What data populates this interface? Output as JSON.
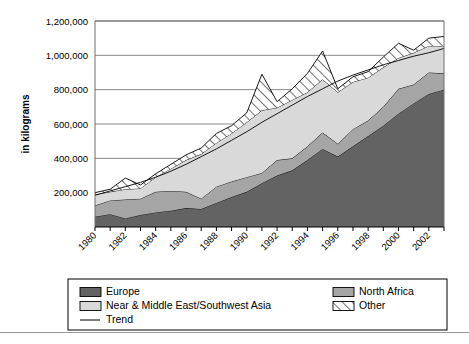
{
  "chart_data": {
    "type": "area",
    "title": "",
    "subtitle": "",
    "xlabel": "",
    "ylabel": "in kilograms",
    "ylim": [
      0,
      1200000
    ],
    "ytick_values": [
      0,
      200000,
      400000,
      600000,
      800000,
      1000000,
      1200000
    ],
    "ytick_labels": [
      "0",
      "200,000",
      "400,000",
      "600,000",
      "800,000",
      "1,000,000",
      "1,200,000"
    ],
    "ytick_label_visible": [
      "",
      "200,000",
      "400,000",
      "600,000",
      "800,000",
      "1,000,000",
      "1,200,000"
    ],
    "grid": true,
    "grid_axis": "y",
    "stacked": true,
    "legend_position": "bottom",
    "x": [
      1980,
      1981,
      1982,
      1983,
      1984,
      1985,
      1986,
      1987,
      1988,
      1989,
      1990,
      1991,
      1992,
      1993,
      1994,
      1995,
      1996,
      1997,
      1998,
      1999,
      2000,
      2001,
      2002,
      2003
    ],
    "xtick_labels": [
      "1980",
      "",
      "1982",
      "",
      "1984",
      "",
      "1986",
      "",
      "1988",
      "",
      "1990",
      "",
      "1992",
      "",
      "1994",
      "",
      "1996",
      "",
      "1998",
      "",
      "2000",
      "",
      "2002",
      ""
    ],
    "xtick_labels_all": [
      "1980",
      "1981",
      "1982",
      "1983",
      "1984",
      "1985",
      "1986",
      "1987",
      "1988",
      "1989",
      "1990",
      "1991",
      "1992",
      "1993",
      "1994",
      "1995",
      "1996",
      "1997",
      "1998",
      "1999",
      "2000",
      "2001",
      "2002",
      "2003"
    ],
    "xtick_rotation": -45,
    "series": [
      {
        "name": "Europe",
        "color": "#636363",
        "pattern": "solid",
        "values": [
          60000,
          75000,
          50000,
          70000,
          85000,
          95000,
          110000,
          105000,
          140000,
          175000,
          205000,
          255000,
          300000,
          330000,
          390000,
          455000,
          410000,
          470000,
          530000,
          590000,
          660000,
          720000,
          775000,
          800000
        ]
      },
      {
        "name": "North Africa",
        "color": "#a5a5a5",
        "pattern": "solid",
        "values": [
          65000,
          80000,
          110000,
          95000,
          120000,
          115000,
          95000,
          60000,
          95000,
          90000,
          85000,
          60000,
          90000,
          70000,
          80000,
          95000,
          75000,
          100000,
          90000,
          110000,
          145000,
          110000,
          125000,
          95000
        ]
      },
      {
        "name": "Near & Middle East/Southwest Asia",
        "color": "#d9d9d9",
        "pattern": "solid",
        "values": [
          65000,
          50000,
          60000,
          60000,
          85000,
          130000,
          185000,
          260000,
          255000,
          280000,
          320000,
          365000,
          305000,
          340000,
          315000,
          310000,
          300000,
          275000,
          250000,
          230000,
          180000,
          185000,
          155000,
          160000
        ]
      },
      {
        "name": "Other",
        "color": "#ffffff",
        "pattern": "hatch",
        "values": [
          10000,
          15000,
          65000,
          20000,
          20000,
          25000,
          30000,
          35000,
          55000,
          45000,
          55000,
          210000,
          35000,
          65000,
          110000,
          165000,
          20000,
          30000,
          35000,
          60000,
          85000,
          15000,
          45000,
          55000
        ]
      }
    ],
    "trend": {
      "name": "Trend",
      "color": "#000000",
      "values": [
        185000,
        210000,
        235000,
        260000,
        290000,
        325000,
        365000,
        410000,
        455000,
        505000,
        555000,
        610000,
        660000,
        710000,
        760000,
        805000,
        850000,
        885000,
        915000,
        945000,
        970000,
        995000,
        1015000,
        1040000
      ]
    },
    "totals": [
      200000,
      220000,
      285000,
      245000,
      310000,
      365000,
      420000,
      460000,
      545000,
      590000,
      665000,
      890000,
      730000,
      805000,
      895000,
      1025000,
      805000,
      875000,
      905000,
      990000,
      1070000,
      1030000,
      1100000,
      1110000
    ]
  },
  "legend": {
    "items": [
      {
        "label": "Europe",
        "swatch": "dark-gray-swatch"
      },
      {
        "label": "North Africa",
        "swatch": "medium-gray-swatch"
      },
      {
        "label": "Near & Middle East/Southwest Asia",
        "swatch": "light-gray-swatch"
      },
      {
        "label": "Other",
        "swatch": "hatched-swatch"
      },
      {
        "label": "Trend",
        "swatch": "line-swatch"
      }
    ]
  }
}
